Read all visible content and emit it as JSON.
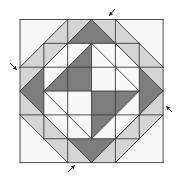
{
  "diagram": {
    "colors": {
      "dark": "#7d7d7d",
      "light": "#d5d5d5",
      "white": "#f8f8f8",
      "line": "#3a3a3a",
      "arrow": "#222222"
    },
    "grid": {
      "origin_x": 20,
      "origin_y": 19.5,
      "unit": 23.85,
      "divisions": 6
    },
    "pieces": [
      {
        "name": "corner-tl-light-strip-top",
        "fill": "light",
        "points": [
          [
            2,
            0
          ],
          [
            2,
            1
          ],
          [
            1,
            1
          ]
        ]
      },
      {
        "name": "corner-tl-light-strip-left",
        "fill": "light",
        "points": [
          [
            1,
            1
          ],
          [
            0,
            2
          ],
          [
            1,
            2
          ]
        ]
      },
      {
        "name": "corner-tl-light-center",
        "fill": "light",
        "points": [
          [
            1,
            1
          ],
          [
            2,
            1
          ],
          [
            1,
            2
          ]
        ]
      },
      {
        "name": "top-left-light",
        "fill": "light",
        "points": [
          [
            2,
            0
          ],
          [
            3,
            0
          ],
          [
            2,
            1
          ]
        ]
      },
      {
        "name": "left-top-light",
        "fill": "light",
        "points": [
          [
            0,
            2
          ],
          [
            1,
            2
          ],
          [
            0,
            3
          ]
        ]
      },
      {
        "name": "corner-tr-light-strip-top",
        "fill": "light",
        "points": [
          [
            4,
            0
          ],
          [
            4,
            1
          ],
          [
            5,
            1
          ]
        ]
      },
      {
        "name": "corner-tr-light-strip-right",
        "fill": "light",
        "points": [
          [
            5,
            1
          ],
          [
            6,
            2
          ],
          [
            5,
            2
          ]
        ]
      },
      {
        "name": "corner-tr-light-center",
        "fill": "light",
        "points": [
          [
            4,
            1
          ],
          [
            5,
            1
          ],
          [
            5,
            2
          ]
        ]
      },
      {
        "name": "top-right-light",
        "fill": "light",
        "points": [
          [
            3,
            0
          ],
          [
            4,
            0
          ],
          [
            4,
            1
          ]
        ]
      },
      {
        "name": "right-top-light",
        "fill": "light",
        "points": [
          [
            6,
            2
          ],
          [
            5,
            2
          ],
          [
            6,
            3
          ]
        ]
      },
      {
        "name": "corner-br-light-strip-bottom",
        "fill": "light",
        "points": [
          [
            4,
            6
          ],
          [
            4,
            5
          ],
          [
            5,
            5
          ]
        ]
      },
      {
        "name": "corner-br-light-strip-right",
        "fill": "light",
        "points": [
          [
            5,
            5
          ],
          [
            6,
            4
          ],
          [
            5,
            4
          ]
        ]
      },
      {
        "name": "corner-br-light-center",
        "fill": "light",
        "points": [
          [
            4,
            5
          ],
          [
            5,
            5
          ],
          [
            5,
            4
          ]
        ]
      },
      {
        "name": "bottom-right-light",
        "fill": "light",
        "points": [
          [
            3,
            6
          ],
          [
            4,
            6
          ],
          [
            4,
            5
          ]
        ]
      },
      {
        "name": "right-bottom-light",
        "fill": "light",
        "points": [
          [
            6,
            4
          ],
          [
            5,
            4
          ],
          [
            6,
            3
          ]
        ]
      },
      {
        "name": "corner-bl-light-strip-bottom",
        "fill": "light",
        "points": [
          [
            2,
            6
          ],
          [
            2,
            5
          ],
          [
            1,
            5
          ]
        ]
      },
      {
        "name": "corner-bl-light-strip-left",
        "fill": "light",
        "points": [
          [
            1,
            5
          ],
          [
            0,
            4
          ],
          [
            1,
            4
          ]
        ]
      },
      {
        "name": "corner-bl-light-center",
        "fill": "light",
        "points": [
          [
            2,
            5
          ],
          [
            1,
            5
          ],
          [
            1,
            4
          ]
        ]
      },
      {
        "name": "bottom-left-light",
        "fill": "light",
        "points": [
          [
            3,
            6
          ],
          [
            2,
            6
          ],
          [
            2,
            5
          ]
        ]
      },
      {
        "name": "left-bottom-light",
        "fill": "light",
        "points": [
          [
            0,
            4
          ],
          [
            1,
            4
          ],
          [
            0,
            3
          ]
        ]
      },
      {
        "name": "top-dark-triangle",
        "fill": "dark",
        "points": [
          [
            3,
            0
          ],
          [
            2,
            1
          ],
          [
            4,
            1
          ]
        ]
      },
      {
        "name": "right-dark-triangle",
        "fill": "dark",
        "points": [
          [
            6,
            3
          ],
          [
            5,
            2
          ],
          [
            5,
            4
          ]
        ]
      },
      {
        "name": "bottom-dark-triangle",
        "fill": "dark",
        "points": [
          [
            3,
            6
          ],
          [
            2,
            5
          ],
          [
            4,
            5
          ]
        ]
      },
      {
        "name": "left-dark-triangle",
        "fill": "dark",
        "points": [
          [
            0,
            3
          ],
          [
            1,
            2
          ],
          [
            1,
            4
          ]
        ]
      },
      {
        "name": "center-dark-upper-left",
        "fill": "dark",
        "points": [
          [
            3,
            1
          ],
          [
            1,
            3
          ],
          [
            3,
            3
          ]
        ]
      },
      {
        "name": "center-dark-lower-right",
        "fill": "dark",
        "points": [
          [
            3,
            3
          ],
          [
            5,
            3
          ],
          [
            3,
            5
          ]
        ]
      },
      {
        "name": "center-white-upper-right",
        "fill": "white",
        "points": [
          [
            3,
            1
          ],
          [
            5,
            3
          ],
          [
            3,
            3
          ]
        ]
      },
      {
        "name": "center-white-lower-left",
        "fill": "white",
        "points": [
          [
            1,
            3
          ],
          [
            3,
            3
          ],
          [
            3,
            5
          ]
        ]
      }
    ],
    "lines": [
      [
        [
          0,
          0
        ],
        [
          6,
          0
        ]
      ],
      [
        [
          6,
          0
        ],
        [
          6,
          6
        ]
      ],
      [
        [
          6,
          6
        ],
        [
          0,
          6
        ]
      ],
      [
        [
          0,
          6
        ],
        [
          0,
          0
        ]
      ],
      [
        [
          2,
          0
        ],
        [
          2,
          1
        ]
      ],
      [
        [
          4,
          0
        ],
        [
          4,
          1
        ]
      ],
      [
        [
          2,
          5
        ],
        [
          2,
          6
        ]
      ],
      [
        [
          4,
          5
        ],
        [
          4,
          6
        ]
      ],
      [
        [
          0,
          2
        ],
        [
          1,
          2
        ]
      ],
      [
        [
          0,
          4
        ],
        [
          1,
          4
        ]
      ],
      [
        [
          5,
          2
        ],
        [
          6,
          2
        ]
      ],
      [
        [
          5,
          4
        ],
        [
          6,
          4
        ]
      ],
      [
        [
          1,
          1
        ],
        [
          5,
          1
        ]
      ],
      [
        [
          1,
          5
        ],
        [
          5,
          5
        ]
      ],
      [
        [
          1,
          1
        ],
        [
          1,
          5
        ]
      ],
      [
        [
          5,
          1
        ],
        [
          5,
          5
        ]
      ],
      [
        [
          1,
          2
        ],
        [
          5,
          2
        ]
      ],
      [
        [
          1,
          4
        ],
        [
          5,
          4
        ]
      ],
      [
        [
          2,
          1
        ],
        [
          2,
          5
        ]
      ],
      [
        [
          4,
          1
        ],
        [
          4,
          5
        ]
      ],
      [
        [
          3,
          1
        ],
        [
          3,
          5
        ]
      ],
      [
        [
          1,
          3
        ],
        [
          5,
          3
        ]
      ],
      [
        [
          2,
          0
        ],
        [
          0,
          2
        ]
      ],
      [
        [
          2,
          1
        ],
        [
          1,
          2
        ]
      ],
      [
        [
          4,
          0
        ],
        [
          6,
          2
        ]
      ],
      [
        [
          4,
          1
        ],
        [
          5,
          2
        ]
      ],
      [
        [
          6,
          4
        ],
        [
          4,
          6
        ]
      ],
      [
        [
          5,
          4
        ],
        [
          4,
          5
        ]
      ],
      [
        [
          0,
          4
        ],
        [
          2,
          6
        ]
      ],
      [
        [
          1,
          4
        ],
        [
          2,
          5
        ]
      ],
      [
        [
          3,
          0
        ],
        [
          6,
          3
        ]
      ],
      [
        [
          6,
          3
        ],
        [
          3,
          6
        ]
      ],
      [
        [
          3,
          6
        ],
        [
          0,
          3
        ]
      ],
      [
        [
          0,
          3
        ],
        [
          3,
          0
        ]
      ],
      [
        [
          3,
          1
        ],
        [
          5,
          3
        ]
      ],
      [
        [
          5,
          3
        ],
        [
          3,
          5
        ]
      ],
      [
        [
          3,
          5
        ],
        [
          1,
          3
        ]
      ],
      [
        [
          1,
          3
        ],
        [
          3,
          1
        ]
      ]
    ],
    "arrows": [
      {
        "name": "arrow-top",
        "x1": 115,
        "y1": 9,
        "x2": 109,
        "y2": 16
      },
      {
        "name": "arrow-left",
        "x1": 10,
        "y1": 63,
        "x2": 17,
        "y2": 70
      },
      {
        "name": "arrow-right",
        "x1": 172,
        "y1": 112,
        "x2": 166,
        "y2": 106
      },
      {
        "name": "arrow-bottom",
        "x1": 68,
        "y1": 172,
        "x2": 75,
        "y2": 165
      }
    ]
  }
}
